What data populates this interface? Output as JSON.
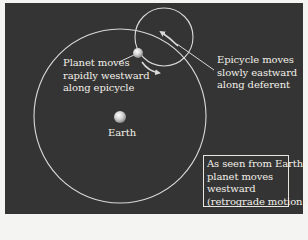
{
  "diagram": {
    "type": "epicycle-deferent",
    "background_color": "#343434",
    "line_color": "#d9d9d9",
    "text_color": "#f2efe8",
    "deferent": {
      "cx": 120,
      "cy": 116,
      "rx": 86,
      "ry": 87
    },
    "epicycle": {
      "cx": 164,
      "cy": 37,
      "r": 29
    },
    "planet": {
      "cx": 138,
      "cy": 53,
      "r": 5
    },
    "earth": {
      "cx": 120,
      "cy": 117,
      "r": 6
    }
  },
  "labels": {
    "planet": {
      "lines": [
        "Planet moves",
        "rapidly westward",
        "along epicycle"
      ]
    },
    "epicycle": {
      "lines": [
        "Epicycle moves",
        "slowly eastward",
        "along deferent"
      ]
    },
    "earth": "Earth",
    "note_box": {
      "lines": [
        "As seen from Earth,",
        "planet moves",
        "westward",
        "(retrograde motion)"
      ]
    }
  }
}
